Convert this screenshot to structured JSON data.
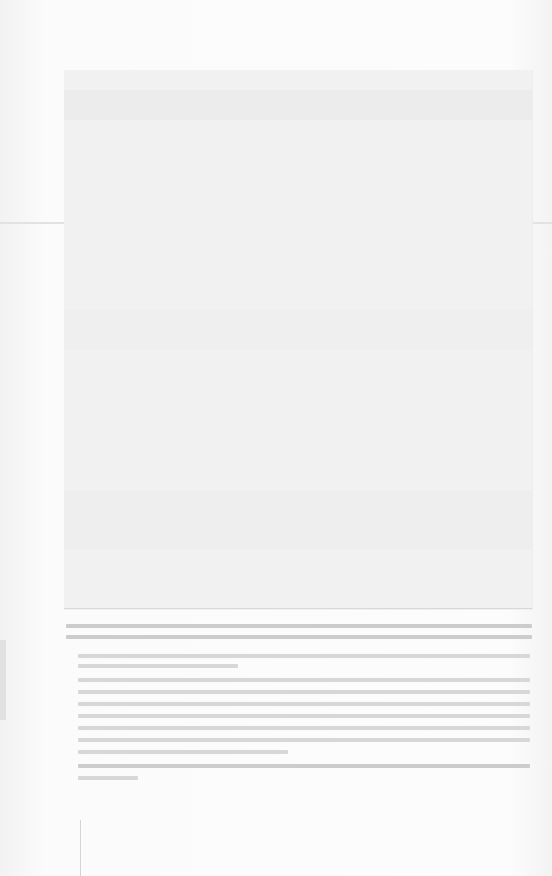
{
  "document": {
    "figure": {
      "kind": "photograph",
      "legible": false
    },
    "caption": {
      "legible": false
    },
    "paragraphs": [
      {
        "lines": 2,
        "legible": false
      },
      {
        "lines": 7,
        "legible": false
      },
      {
        "lines": 1,
        "legible": false
      }
    ]
  }
}
